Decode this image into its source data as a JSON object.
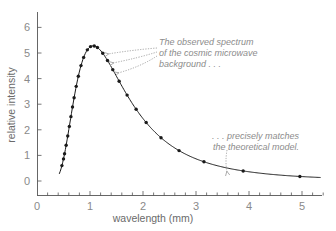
{
  "chart_data": {
    "type": "scatter",
    "title": "",
    "xlabel": "wavelength (mm)",
    "ylabel": "relative intensity",
    "xlim": [
      0,
      5.4
    ],
    "ylim": [
      -0.55,
      6.6
    ],
    "x_ticks": [
      0,
      1,
      2,
      3,
      4,
      5
    ],
    "y_ticks": [
      0,
      1,
      2,
      3,
      4,
      5,
      6
    ],
    "grid": false,
    "legend": null,
    "series": [
      {
        "name": "observed spectrum (points)",
        "style": "markers",
        "x": [
          0.47,
          0.5,
          0.52,
          0.55,
          0.58,
          0.61,
          0.64,
          0.67,
          0.7,
          0.74,
          0.78,
          0.83,
          0.88,
          0.95,
          1.01,
          1.08,
          1.14,
          1.24,
          1.33,
          1.43,
          1.55,
          1.7,
          1.87,
          2.06,
          2.34,
          2.68,
          3.15,
          3.89,
          4.96
        ],
        "y": [
          0.75,
          1.05,
          1.35,
          1.7,
          2.05,
          2.45,
          2.8,
          3.15,
          3.55,
          3.95,
          4.35,
          4.75,
          5.05,
          5.25,
          5.28,
          5.25,
          5.1,
          4.7,
          4.3,
          3.95,
          3.55,
          3.2,
          2.58,
          1.95,
          1.33,
          0.86,
          0.47,
          0.2,
          0.08
        ]
      },
      {
        "name": "theoretical model (blackbody curve)",
        "style": "line",
        "x_range": [
          0.42,
          5.35
        ],
        "peak": {
          "x": 1.06,
          "y": 5.28
        }
      }
    ],
    "annotations": [
      {
        "text": "The observed spectrum of the cosmic microwave background . . .",
        "points_to": "data points near x=1.3-1.5"
      },
      {
        "text": ". . . precisely matches the theoretical model.",
        "points_to": "curve near x=3.6"
      }
    ]
  },
  "annotations": {
    "top": [
      "The observed spectrum",
      "of the cosmic microwave",
      "background . . ."
    ],
    "bottom": [
      ". . . precisely matches",
      "the theoretical model."
    ]
  },
  "axes": {
    "x_title": "wavelength (mm)",
    "y_title": "relative intensity",
    "x_tick_labels": [
      "0",
      "1",
      "2",
      "3",
      "4",
      "5"
    ],
    "y_tick_labels": [
      "0",
      "1",
      "2",
      "3",
      "4",
      "5",
      "6"
    ]
  },
  "colors": {
    "curve": "#1a1a1a",
    "points": "#1a1a1a",
    "axis": "#555555",
    "labels": "#8a8a8a",
    "annotation": "#8c8c8c"
  }
}
